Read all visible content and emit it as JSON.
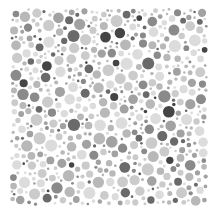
{
  "image": {
    "description": "Grayscale dot-pattern plate (pseudo-isochromatic style) filled with randomly packed circles of varying sizes and gray tones",
    "width": 220,
    "height": 214,
    "background": "#ffffff",
    "plate_bounds": {
      "x": 10,
      "y": 8,
      "width": 198,
      "height": 198
    }
  },
  "palette": {
    "very_light": "#dcdcdc",
    "light": "#cbcbcb",
    "light_mid": "#b8b8b8",
    "mid": "#a2a2a2",
    "mid_dark": "#8a8a8a",
    "dark": "#6a6a6a",
    "very_dark": "#454545"
  },
  "generation": {
    "seed": 7341,
    "attempts": 9000,
    "min_radius": 1.3,
    "max_radius": 6.2,
    "gap": 0.9,
    "weights": {
      "very_light": 0.22,
      "light": 0.24,
      "light_mid": 0.18,
      "mid": 0.14,
      "mid_dark": 0.1,
      "dark": 0.08,
      "very_dark": 0.04
    }
  }
}
